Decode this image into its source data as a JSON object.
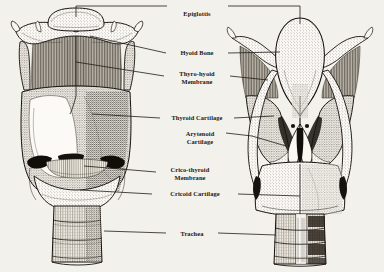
{
  "diagram": {
    "views": [
      {
        "id": "anterior",
        "name": "Anterior view of larynx",
        "side": "left"
      },
      {
        "id": "posterior",
        "name": "Posterior view of larynx",
        "side": "right"
      }
    ],
    "style": {
      "ink_color": "#15120e",
      "paper_color": "#f3f1ec",
      "leader_color": "#201c18",
      "label_color": "#1a1713"
    },
    "labels": [
      {
        "id": "epiglottis",
        "text": "Epiglottis",
        "lines": [
          "Epiglottis"
        ],
        "x": 197,
        "y": 16,
        "leader_left": true,
        "leader_right": true
      },
      {
        "id": "hyoid-bone",
        "text": "Hyoid Bone",
        "lines": [
          "Hyoid Bone"
        ],
        "x": 197,
        "y": 55,
        "leader_left": true,
        "leader_right": true
      },
      {
        "id": "thyro-hyoid-membrane",
        "text": "Thyro-hyoid Membrane",
        "lines": [
          "Thyro-hyoid",
          "Membrane"
        ],
        "x": 197,
        "y": 76,
        "leader_left": true,
        "leader_right": true
      },
      {
        "id": "thyroid-cartilage",
        "text": "Thyroid Cartilage",
        "lines": [
          "Thyroid Cartilage"
        ],
        "x": 197,
        "y": 118,
        "leader_left": true,
        "leader_right": true
      },
      {
        "id": "arytenoid-cartilage",
        "text": "Arytenoid Cartilage",
        "lines": [
          "Arytenoid",
          "Cartilage"
        ],
        "x": 201,
        "y": 136,
        "leader_left": false,
        "leader_right": true
      },
      {
        "id": "crico-thyroid-membrane",
        "text": "Crico-thyroid Membrane",
        "lines": [
          "Crico-thyroid",
          "Membrane"
        ],
        "x": 190,
        "y": 172,
        "leader_left": true,
        "leader_right": false
      },
      {
        "id": "cricoid-cartilage",
        "text": "Cricoid Cartilage",
        "lines": [
          "Cricoid Cartilage"
        ],
        "x": 195,
        "y": 195,
        "leader_left": true,
        "leader_right": true
      },
      {
        "id": "trachea",
        "text": "Trachea",
        "lines": [
          "Trachea"
        ],
        "x": 192,
        "y": 234,
        "leader_left": true,
        "leader_right": true
      }
    ]
  }
}
